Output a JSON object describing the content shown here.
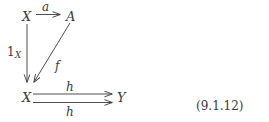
{
  "figure": {
    "equation_number": "(9.1.12)",
    "ink_color": "#3a3a3a",
    "background_color": "#ffffff"
  },
  "diagram": {
    "type": "commutative-diagram",
    "nodes": [
      {
        "id": "x-top",
        "label": "X",
        "x": 22,
        "y": 10
      },
      {
        "id": "a-top",
        "label": "A",
        "x": 66,
        "y": 10
      },
      {
        "id": "x-bottom",
        "label": "X",
        "x": 22,
        "y": 91
      },
      {
        "id": "y-bottom",
        "label": "Y",
        "x": 117,
        "y": 91
      }
    ],
    "edges": [
      {
        "id": "edge-a",
        "label": "a",
        "subscript": "",
        "from": "x-top",
        "to": "a-top",
        "label_x": 42,
        "label_y": 1,
        "upright": false
      },
      {
        "id": "edge-identity",
        "label": "1",
        "subscript": "X",
        "from": "x-top",
        "to": "x-bottom",
        "label_x": 7,
        "label_y": 46,
        "upright": true
      },
      {
        "id": "edge-f",
        "label": "f",
        "subscript": "",
        "from": "a-top",
        "to": "x-bottom",
        "label_x": 55,
        "label_y": 60,
        "upright": false
      },
      {
        "id": "edge-h-upper",
        "label": "h",
        "subscript": "",
        "from": "x-bottom",
        "to": "y-bottom",
        "label_x": 66,
        "label_y": 81,
        "upright": false
      },
      {
        "id": "edge-h-lower",
        "label": "h",
        "subscript": "",
        "from": "x-bottom",
        "to": "y-bottom",
        "label_x": 66,
        "label_y": 106,
        "upright": false
      }
    ]
  }
}
